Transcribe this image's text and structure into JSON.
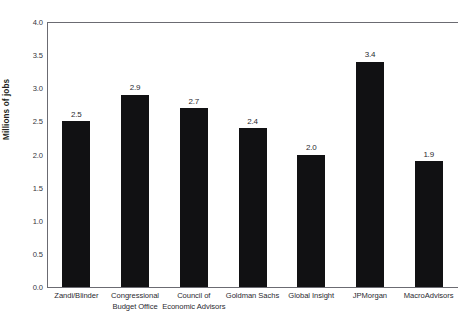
{
  "chart_data": {
    "type": "bar",
    "title": "",
    "xlabel": "",
    "ylabel": "Millions of jobs",
    "ylim": [
      0,
      4.0
    ],
    "ytick_step": 0.5,
    "grid": false,
    "legend": "none",
    "bar_color": "#111113",
    "axis_color": "#6b6b72",
    "categories": [
      "Zandi/Blinder",
      "Congressional Budget Office",
      "Council of Economic Advisors",
      "Goldman Sachs",
      "Global Insight",
      "JPMorgan",
      "MacroAdvisors"
    ],
    "category_lines": [
      [
        "Zandi/Blinder"
      ],
      [
        "Congressional",
        "Budget Office"
      ],
      [
        "Council of",
        "Economic Advisors"
      ],
      [
        "Goldman Sachs"
      ],
      [
        "Global Insight"
      ],
      [
        "JPMorgan"
      ],
      [
        "MacroAdvisors"
      ]
    ],
    "values": [
      2.5,
      2.9,
      2.7,
      2.4,
      2.0,
      3.4,
      1.9
    ],
    "value_labels": [
      "2.5",
      "2.9",
      "2.7",
      "2.4",
      "2.0",
      "3.4",
      "1.9"
    ],
    "ytick_labels": [
      "4.0",
      "3.5",
      "3.0",
      "2.5",
      "2.0",
      "1.5",
      "1.0",
      "0.5",
      "0.0"
    ],
    "ytick_values": [
      4.0,
      3.5,
      3.0,
      2.5,
      2.0,
      1.5,
      1.0,
      0.5,
      0.0
    ]
  }
}
